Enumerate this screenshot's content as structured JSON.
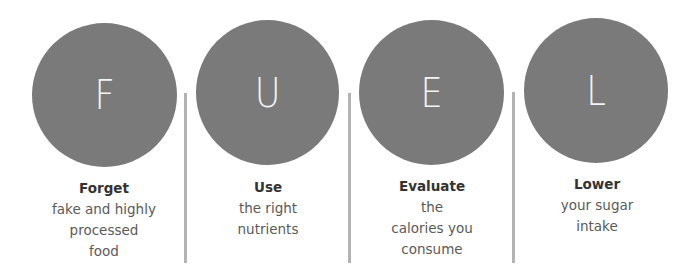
{
  "diagram": {
    "acronym": "FUEL",
    "colors": {
      "circle_fill": "#7a7a7a",
      "letter": "#f4f4f4",
      "divider": "#b3b3b3",
      "title_text": "#333333",
      "body_text": "#5a5a5a"
    },
    "items": [
      {
        "letter": "F",
        "title": "Forget",
        "lines": [
          "fake and highly",
          "processed",
          "food"
        ]
      },
      {
        "letter": "U",
        "title": "Use",
        "lines": [
          "the right",
          "nutrients"
        ]
      },
      {
        "letter": "E",
        "title": "Evaluate",
        "lines": [
          "the",
          "calories you",
          "consume"
        ]
      },
      {
        "letter": "L",
        "title": "Lower",
        "lines": [
          "your sugar",
          "intake"
        ]
      }
    ]
  }
}
